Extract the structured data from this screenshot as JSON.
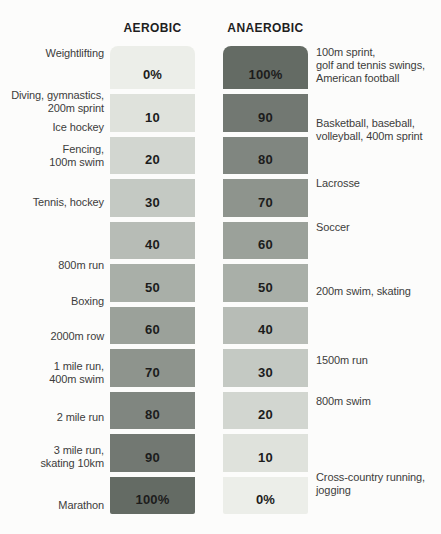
{
  "header": {
    "aerobic": "AEROBIC",
    "anaerobic": "ANAEROBIC"
  },
  "chart_data": {
    "type": "bar",
    "subtype": "paired-percentage-scale",
    "title": "",
    "columns": [
      "AEROBIC",
      "ANAEROBIC"
    ],
    "rows": [
      {
        "aerobic": 0,
        "anaerobic": 100,
        "aerobic_label": "0%",
        "anaerobic_label": "100%"
      },
      {
        "aerobic": 10,
        "anaerobic": 90,
        "aerobic_label": "10",
        "anaerobic_label": "90"
      },
      {
        "aerobic": 20,
        "anaerobic": 80,
        "aerobic_label": "20",
        "anaerobic_label": "80"
      },
      {
        "aerobic": 30,
        "anaerobic": 70,
        "aerobic_label": "30",
        "anaerobic_label": "70"
      },
      {
        "aerobic": 40,
        "anaerobic": 60,
        "aerobic_label": "40",
        "anaerobic_label": "60"
      },
      {
        "aerobic": 50,
        "anaerobic": 50,
        "aerobic_label": "50",
        "anaerobic_label": "50"
      },
      {
        "aerobic": 60,
        "anaerobic": 40,
        "aerobic_label": "60",
        "anaerobic_label": "40"
      },
      {
        "aerobic": 70,
        "anaerobic": 30,
        "aerobic_label": "70",
        "anaerobic_label": "30"
      },
      {
        "aerobic": 80,
        "anaerobic": 20,
        "aerobic_label": "80",
        "anaerobic_label": "20"
      },
      {
        "aerobic": 90,
        "anaerobic": 10,
        "aerobic_label": "90",
        "anaerobic_label": "10"
      },
      {
        "aerobic": 100,
        "anaerobic": 0,
        "aerobic_label": "100%",
        "anaerobic_label": "0%"
      }
    ],
    "left_annotations": [
      {
        "row": 0,
        "lines": [
          "Weightlifting"
        ]
      },
      {
        "row": 1,
        "lines": [
          "Diving, gymnastics,",
          "200m sprint"
        ]
      },
      {
        "row": 1,
        "lines": [
          "Ice hockey"
        ]
      },
      {
        "row": 2,
        "lines": [
          "Fencing,",
          "100m swim"
        ]
      },
      {
        "row": 3,
        "lines": [
          "Tennis, hockey"
        ]
      },
      {
        "row": 5,
        "lines": [
          "800m run"
        ]
      },
      {
        "row": 5,
        "lines": [
          "Boxing"
        ]
      },
      {
        "row": 6,
        "lines": [
          "2000m row"
        ]
      },
      {
        "row": 7,
        "lines": [
          "1 mile run,",
          "400m swim"
        ]
      },
      {
        "row": 8,
        "lines": [
          "2 mile run"
        ]
      },
      {
        "row": 9,
        "lines": [
          "3 mile run,",
          "skating 10km"
        ]
      },
      {
        "row": 10,
        "lines": [
          "Marathon"
        ]
      }
    ],
    "right_annotations": [
      {
        "row": 0,
        "lines": [
          "100m sprint,",
          "golf and tennis swings,",
          "American football"
        ]
      },
      {
        "row": 1,
        "lines": [
          "Basketball, baseball,",
          "volleyball, 400m sprint"
        ]
      },
      {
        "row": 3,
        "lines": [
          "Lacrosse"
        ]
      },
      {
        "row": 4,
        "lines": [
          "Soccer"
        ]
      },
      {
        "row": 5,
        "lines": [
          "200m swim, skating"
        ]
      },
      {
        "row": 7,
        "lines": [
          "1500m run"
        ]
      },
      {
        "row": 8,
        "lines": [
          "800m swim"
        ]
      },
      {
        "row": 10,
        "lines": [
          "Cross-country running,",
          "jogging"
        ]
      }
    ],
    "colors": {
      "shades": [
        "#eceee9",
        "#dfe2dc",
        "#d2d6d0",
        "#c4c9c3",
        "#b7bcb6",
        "#a9afa8",
        "#9ba19a",
        "#8e948d",
        "#808680",
        "#727872",
        "#646b64"
      ],
      "value_text": "#1c1c1c",
      "annotation_text": "#3c3c3c",
      "background": "#fcfcfb"
    }
  }
}
